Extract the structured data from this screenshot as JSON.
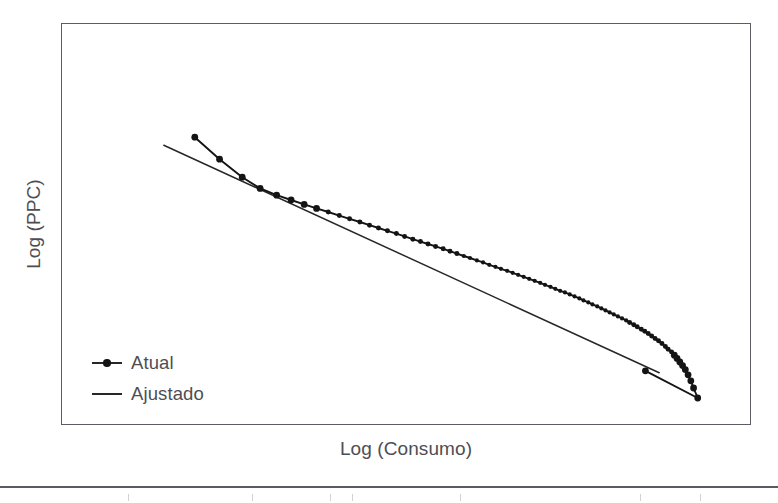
{
  "figure": {
    "background_color": "#ffffff",
    "frame_color": "#5c5c64",
    "text_color": "#4e4e52"
  },
  "axes": {
    "x_title": "Log (Consumo)",
    "y_title": "Log (PPC)",
    "x_tick_labels": [],
    "y_tick_labels": []
  },
  "legend": {
    "items": [
      {
        "label": "Atual",
        "key": "line-with-marker",
        "color": "#141414"
      },
      {
        "label": "Ajustado",
        "key": "line",
        "color": "#272727"
      }
    ]
  },
  "chart_data": {
    "type": "line",
    "title": "",
    "subtitle": "",
    "xlabel": "Log (Consumo)",
    "ylabel": "Log (PPC)",
    "xlim": [
      0,
      1
    ],
    "ylim": [
      0,
      1
    ],
    "grid": false,
    "legend_position": "lower-left",
    "annotations": [],
    "x_tick_labels": [],
    "y_tick_labels": [],
    "note": "Log-log rank-size style plot. Axes are unlabeled (no numeric ticks); coordinates below are normalized 0-1 within the plot frame, x increasing right, y increasing up.",
    "series": [
      {
        "name": "Atual",
        "style": "line-with-markers",
        "color": "#141414",
        "marker": "circle",
        "points": [
          [
            0.193,
            0.717
          ],
          [
            0.229,
            0.662
          ],
          [
            0.262,
            0.617
          ],
          [
            0.288,
            0.589
          ],
          [
            0.312,
            0.572
          ],
          [
            0.333,
            0.56
          ],
          [
            0.352,
            0.549
          ],
          [
            0.37,
            0.539
          ],
          [
            0.387,
            0.53
          ],
          [
            0.403,
            0.521
          ],
          [
            0.418,
            0.513
          ],
          [
            0.433,
            0.505
          ],
          [
            0.447,
            0.497
          ],
          [
            0.46,
            0.49
          ],
          [
            0.473,
            0.483
          ],
          [
            0.486,
            0.476
          ],
          [
            0.498,
            0.469
          ],
          [
            0.51,
            0.462
          ],
          [
            0.521,
            0.456
          ],
          [
            0.532,
            0.45
          ],
          [
            0.543,
            0.444
          ],
          [
            0.554,
            0.438
          ],
          [
            0.564,
            0.432
          ],
          [
            0.574,
            0.426
          ],
          [
            0.584,
            0.42
          ],
          [
            0.593,
            0.415
          ],
          [
            0.603,
            0.409
          ],
          [
            0.612,
            0.404
          ],
          [
            0.621,
            0.398
          ],
          [
            0.63,
            0.393
          ],
          [
            0.638,
            0.388
          ],
          [
            0.647,
            0.383
          ],
          [
            0.655,
            0.378
          ],
          [
            0.663,
            0.373
          ],
          [
            0.671,
            0.368
          ],
          [
            0.679,
            0.363
          ],
          [
            0.687,
            0.358
          ],
          [
            0.695,
            0.353
          ],
          [
            0.702,
            0.348
          ],
          [
            0.71,
            0.343
          ],
          [
            0.717,
            0.338
          ],
          [
            0.724,
            0.333
          ],
          [
            0.731,
            0.329
          ],
          [
            0.738,
            0.324
          ],
          [
            0.745,
            0.319
          ],
          [
            0.752,
            0.314
          ],
          [
            0.758,
            0.309
          ],
          [
            0.765,
            0.304
          ],
          [
            0.771,
            0.299
          ],
          [
            0.778,
            0.294
          ],
          [
            0.784,
            0.289
          ],
          [
            0.79,
            0.284
          ],
          [
            0.796,
            0.279
          ],
          [
            0.802,
            0.274
          ],
          [
            0.808,
            0.269
          ],
          [
            0.814,
            0.264
          ],
          [
            0.82,
            0.259
          ],
          [
            0.825,
            0.254
          ],
          [
            0.831,
            0.248
          ],
          [
            0.836,
            0.243
          ],
          [
            0.842,
            0.237
          ],
          [
            0.847,
            0.232
          ],
          [
            0.852,
            0.226
          ],
          [
            0.857,
            0.22
          ],
          [
            0.862,
            0.214
          ],
          [
            0.867,
            0.208
          ],
          [
            0.872,
            0.201
          ],
          [
            0.877,
            0.194
          ],
          [
            0.881,
            0.187
          ],
          [
            0.886,
            0.18
          ],
          [
            0.89,
            0.172
          ],
          [
            0.894,
            0.164
          ],
          [
            0.898,
            0.155
          ],
          [
            0.902,
            0.146
          ],
          [
            0.906,
            0.136
          ],
          [
            0.91,
            0.123
          ],
          [
            0.914,
            0.108
          ],
          [
            0.918,
            0.09
          ],
          [
            0.924,
            0.065
          ],
          [
            0.848,
            0.133
          ]
        ]
      },
      {
        "name": "Ajustado",
        "style": "line",
        "color": "#272727",
        "fit_endpoints": [
          [
            0.148,
            0.697
          ],
          [
            0.868,
            0.128
          ]
        ]
      }
    ]
  }
}
